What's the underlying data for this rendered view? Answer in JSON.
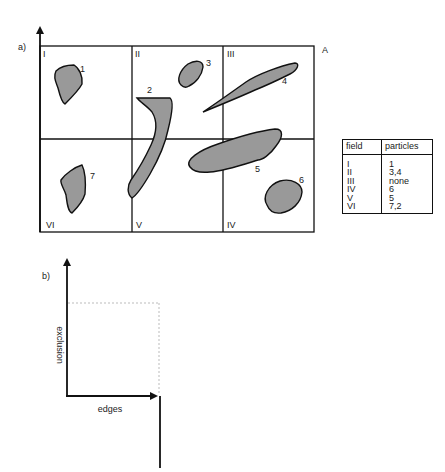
{
  "panel_a": {
    "label": "a)",
    "corner_label": "A",
    "fields": [
      {
        "id": "I",
        "position": "top-left"
      },
      {
        "id": "II",
        "position": "top-middle"
      },
      {
        "id": "III",
        "position": "top-right"
      },
      {
        "id": "IV",
        "position": "bottom-right"
      },
      {
        "id": "V",
        "position": "bottom-middle"
      },
      {
        "id": "VI",
        "position": "bottom-left"
      }
    ],
    "particles": [
      {
        "id": "1"
      },
      {
        "id": "2"
      },
      {
        "id": "3"
      },
      {
        "id": "4"
      },
      {
        "id": "5"
      },
      {
        "id": "6"
      },
      {
        "id": "7"
      }
    ],
    "particle_fill": "#999999"
  },
  "table": {
    "headers": [
      "field",
      "particles"
    ],
    "rows": [
      {
        "field": "I",
        "particles": "1"
      },
      {
        "field": "II",
        "particles": "3,4"
      },
      {
        "field": "III",
        "particles": "none"
      },
      {
        "field": "IV",
        "particles": "6"
      },
      {
        "field": "V",
        "particles": "5"
      },
      {
        "field": "VI",
        "particles": "7,2"
      }
    ]
  },
  "panel_b": {
    "label": "b)",
    "y_axis_label": "exclusion",
    "x_axis_label": "edges"
  }
}
